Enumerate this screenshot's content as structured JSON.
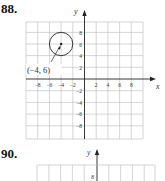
{
  "problems": [
    {
      "number": "88.",
      "graph": {
        "x_axis_label": "x",
        "y_axis_label": "y",
        "x_ticks": [
          "−8",
          "−6",
          "−4",
          "−2",
          "2",
          "4",
          "6",
          "8"
        ],
        "y_ticks": [
          "8",
          "6",
          "4",
          "2",
          "−2",
          "−4",
          "−6",
          "−8"
        ],
        "circle_center_label": "(−4, 6)",
        "circle_center": [
          -4,
          6
        ],
        "circle_radius": 2
      }
    },
    {
      "number": "90.",
      "graph": {
        "y_axis_label": "y",
        "y_ticks": [
          "8"
        ]
      }
    }
  ]
}
